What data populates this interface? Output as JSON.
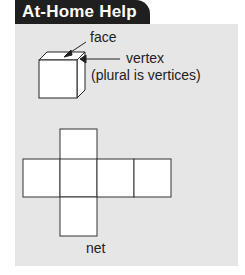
{
  "header": {
    "title": "At-Home Help",
    "bg_color": "#1f1f1f",
    "text_color": "#ffffff"
  },
  "panel": {
    "bg_color": "#e6e6e6"
  },
  "cube_diagram": {
    "labels": {
      "face": "face",
      "vertex": "vertex",
      "vertex_note": "(plural is vertices)"
    }
  },
  "net_diagram": {
    "label": "net",
    "squares": 6
  }
}
